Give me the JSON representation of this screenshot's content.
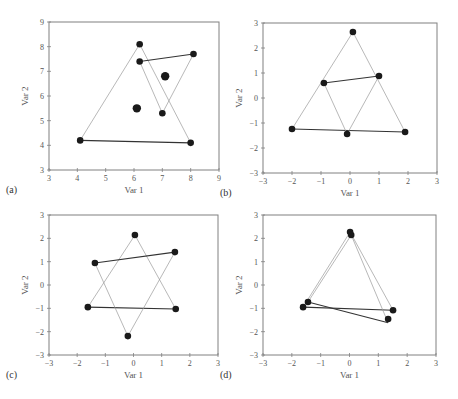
{
  "figure": {
    "width": 458,
    "height": 399,
    "colors": {
      "frame": "#808080",
      "thin_line": "#9a9a9a",
      "thick_line": "#333333",
      "point": "#1a1a1a",
      "text": "#555555"
    }
  },
  "chart_data": [
    {
      "type": "scatter",
      "panel_label": "(a)",
      "title": "",
      "xlabel": "Var 1",
      "ylabel": "Var 2",
      "xlim": [
        3,
        9
      ],
      "ylim": [
        3,
        9
      ],
      "xticks": [
        3,
        4,
        5,
        6,
        7,
        8,
        9
      ],
      "yticks": [
        3,
        4,
        5,
        6,
        7,
        8,
        9
      ],
      "xtick_labels": [
        "3",
        "4",
        "5",
        "6",
        "7",
        "8",
        "9"
      ],
      "ytick_labels": [
        "3",
        "4",
        "5",
        "6",
        "7",
        "8",
        "9"
      ],
      "grid": false,
      "box": {
        "left": 49,
        "top": 22,
        "right": 219,
        "bottom": 170
      },
      "points": [
        {
          "x": 6.2,
          "y": 8.1,
          "size": "normal"
        },
        {
          "x": 4.1,
          "y": 4.2,
          "size": "normal"
        },
        {
          "x": 8.0,
          "y": 4.1,
          "size": "normal"
        },
        {
          "x": 6.2,
          "y": 7.4,
          "size": "normal"
        },
        {
          "x": 8.1,
          "y": 7.7,
          "size": "normal"
        },
        {
          "x": 7.0,
          "y": 5.3,
          "size": "normal"
        },
        {
          "x": 7.1,
          "y": 6.8,
          "size": "large"
        },
        {
          "x": 6.1,
          "y": 5.5,
          "size": "large"
        }
      ],
      "segments": [
        {
          "from": [
            6.2,
            8.1
          ],
          "to": [
            4.1,
            4.2
          ],
          "style": "thin"
        },
        {
          "from": [
            6.2,
            8.1
          ],
          "to": [
            8.0,
            4.1
          ],
          "style": "thin"
        },
        {
          "from": [
            4.1,
            4.2
          ],
          "to": [
            8.0,
            4.1
          ],
          "style": "thick"
        },
        {
          "from": [
            6.2,
            7.4
          ],
          "to": [
            7.0,
            5.3
          ],
          "style": "thin"
        },
        {
          "from": [
            8.1,
            7.7
          ],
          "to": [
            7.0,
            5.3
          ],
          "style": "thin"
        },
        {
          "from": [
            6.2,
            7.4
          ],
          "to": [
            8.1,
            7.7
          ],
          "style": "thick"
        }
      ]
    },
    {
      "type": "scatter",
      "panel_label": "(b)",
      "title": "",
      "xlabel": "Var 1",
      "ylabel": "Var 2",
      "xlim": [
        -3,
        3
      ],
      "ylim": [
        -3,
        3
      ],
      "xticks": [
        -3,
        -2,
        -1,
        0,
        1,
        2,
        3
      ],
      "yticks": [
        -3,
        -2,
        -1,
        0,
        1,
        2,
        3
      ],
      "xtick_labels": [
        "−3",
        "−2",
        "−1",
        "0",
        "1",
        "2",
        "3"
      ],
      "ytick_labels": [
        "−3",
        "−2",
        "−1",
        "0",
        "1",
        "2",
        "3"
      ],
      "grid": false,
      "box": {
        "left": 263,
        "top": 23,
        "right": 437,
        "bottom": 173
      },
      "points": [
        {
          "x": 0.1,
          "y": 2.64,
          "size": "normal"
        },
        {
          "x": -2.0,
          "y": -1.24,
          "size": "normal"
        },
        {
          "x": 1.9,
          "y": -1.36,
          "size": "normal"
        },
        {
          "x": -0.9,
          "y": 0.6,
          "size": "normal"
        },
        {
          "x": 1.0,
          "y": 0.88,
          "size": "normal"
        },
        {
          "x": -0.1,
          "y": -1.44,
          "size": "normal"
        }
      ],
      "segments": [
        {
          "from": [
            0.1,
            2.64
          ],
          "to": [
            -2.0,
            -1.24
          ],
          "style": "thin"
        },
        {
          "from": [
            0.1,
            2.64
          ],
          "to": [
            1.9,
            -1.36
          ],
          "style": "thin"
        },
        {
          "from": [
            -2.0,
            -1.24
          ],
          "to": [
            1.9,
            -1.36
          ],
          "style": "thick"
        },
        {
          "from": [
            -0.9,
            0.6
          ],
          "to": [
            -0.1,
            -1.44
          ],
          "style": "thin"
        },
        {
          "from": [
            1.0,
            0.88
          ],
          "to": [
            -0.1,
            -1.44
          ],
          "style": "thin"
        },
        {
          "from": [
            -0.9,
            0.6
          ],
          "to": [
            1.0,
            0.88
          ],
          "style": "thick"
        }
      ]
    },
    {
      "type": "scatter",
      "panel_label": "(c)",
      "title": "",
      "xlabel": "Var 1",
      "ylabel": "Var 2",
      "xlim": [
        -3,
        3
      ],
      "ylim": [
        -3,
        3
      ],
      "xticks": [
        -3,
        -2,
        -1,
        0,
        1,
        2,
        3
      ],
      "yticks": [
        -3,
        -2,
        -1,
        0,
        1,
        2,
        3
      ],
      "xtick_labels": [
        "−3",
        "−2",
        "−1",
        "0",
        "1",
        "2",
        "3"
      ],
      "ytick_labels": [
        "−3",
        "−2",
        "−1",
        "0",
        "1",
        "2",
        "3"
      ],
      "grid": false,
      "box": {
        "left": 49,
        "top": 215,
        "right": 218,
        "bottom": 355
      },
      "points": [
        {
          "x": 0.05,
          "y": 2.14,
          "size": "normal"
        },
        {
          "x": -1.62,
          "y": -0.95,
          "size": "normal"
        },
        {
          "x": 1.5,
          "y": -1.03,
          "size": "normal"
        },
        {
          "x": -1.37,
          "y": 0.94,
          "size": "normal"
        },
        {
          "x": 1.47,
          "y": 1.41,
          "size": "normal"
        },
        {
          "x": -0.2,
          "y": -2.19,
          "size": "normal"
        }
      ],
      "segments": [
        {
          "from": [
            0.05,
            2.14
          ],
          "to": [
            -1.62,
            -0.95
          ],
          "style": "thin"
        },
        {
          "from": [
            0.05,
            2.14
          ],
          "to": [
            1.5,
            -1.03
          ],
          "style": "thin"
        },
        {
          "from": [
            -1.62,
            -0.95
          ],
          "to": [
            1.5,
            -1.03
          ],
          "style": "thick"
        },
        {
          "from": [
            -1.37,
            0.94
          ],
          "to": [
            -0.2,
            -2.19
          ],
          "style": "thin"
        },
        {
          "from": [
            1.47,
            1.41
          ],
          "to": [
            -0.2,
            -2.19
          ],
          "style": "thin"
        },
        {
          "from": [
            -1.37,
            0.94
          ],
          "to": [
            1.47,
            1.41
          ],
          "style": "thick"
        }
      ]
    },
    {
      "type": "scatter",
      "panel_label": "(d)",
      "title": "",
      "xlabel": "Var 1",
      "ylabel": "Var 2",
      "xlim": [
        -3,
        3
      ],
      "ylim": [
        -3,
        3
      ],
      "xticks": [
        -3,
        -2,
        -1,
        0,
        1,
        2,
        3
      ],
      "yticks": [
        -3,
        -2,
        -1,
        0,
        1,
        2,
        3
      ],
      "xtick_labels": [
        "−3",
        "−2",
        "−1",
        "0",
        "1",
        "2",
        "3"
      ],
      "ytick_labels": [
        "−3",
        "−2",
        "−1",
        "0",
        "1",
        "2",
        "3"
      ],
      "grid": false,
      "box": {
        "left": 263,
        "top": 215,
        "right": 436,
        "bottom": 355
      },
      "points": [
        {
          "x": 0.02,
          "y": 2.27,
          "size": "normal"
        },
        {
          "x": -1.61,
          "y": -0.95,
          "size": "normal"
        },
        {
          "x": 1.51,
          "y": -1.08,
          "size": "normal"
        },
        {
          "x": 0.06,
          "y": 2.14,
          "size": "normal"
        },
        {
          "x": -1.44,
          "y": -0.73,
          "size": "normal"
        },
        {
          "x": 1.34,
          "y": -1.46,
          "size": "normal"
        }
      ],
      "segments": [
        {
          "from": [
            0.02,
            2.27
          ],
          "to": [
            -1.61,
            -0.95
          ],
          "style": "thin"
        },
        {
          "from": [
            0.02,
            2.27
          ],
          "to": [
            1.51,
            -1.08
          ],
          "style": "thin"
        },
        {
          "from": [
            -1.61,
            -0.95
          ],
          "to": [
            1.51,
            -1.08
          ],
          "style": "thick"
        },
        {
          "from": [
            0.06,
            2.14
          ],
          "to": [
            -1.44,
            -0.73
          ],
          "style": "thin"
        },
        {
          "from": [
            0.06,
            2.14
          ],
          "to": [
            1.34,
            -1.62
          ],
          "style": "thin"
        },
        {
          "from": [
            -1.44,
            -0.73
          ],
          "to": [
            1.34,
            -1.62
          ],
          "style": "thick"
        }
      ]
    }
  ]
}
